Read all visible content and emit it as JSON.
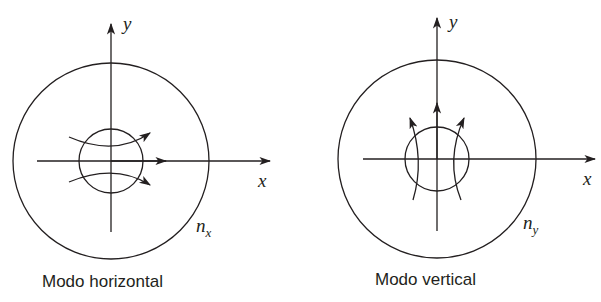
{
  "diagrams": [
    {
      "id": "horizontal",
      "caption": "Modo horizontal",
      "axis_labels": {
        "x": "x",
        "y": "y"
      },
      "index_label": {
        "base": "n",
        "subscript": "x"
      },
      "field_direction": "horizontal"
    },
    {
      "id": "vertical",
      "caption": "Modo vertical",
      "axis_labels": {
        "x": "x",
        "y": "y"
      },
      "index_label": {
        "base": "n",
        "subscript": "y"
      },
      "field_direction": "vertical"
    }
  ],
  "colors": {
    "line": "#231f20",
    "background": "#ffffff"
  }
}
